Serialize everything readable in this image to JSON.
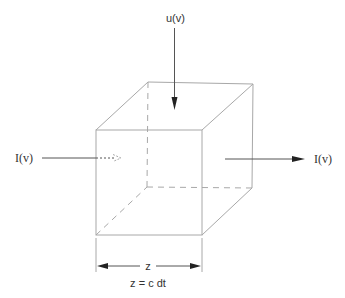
{
  "diagram": {
    "type": "cube-radiative-transfer",
    "labels": {
      "incident_top": "u(v)",
      "incoming_left": "I(v)",
      "outgoing_right": "I(v)",
      "dimension": "z",
      "equation": "z = c dt"
    },
    "colors": {
      "edge": "#a8a8a8",
      "arrow": "#555555",
      "arrowhead": "#222222",
      "text": "#333333",
      "background": "#ffffff"
    }
  }
}
